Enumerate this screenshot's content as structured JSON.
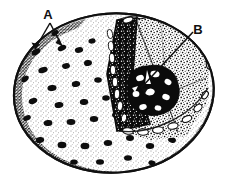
{
  "figure": {
    "medium": "black-and-white stipple line drawing",
    "background_color": "#ffffff",
    "ink_color": "#101010",
    "width_px": 225,
    "height_px": 182
  },
  "labels": [
    {
      "id": "label-a",
      "text": "A",
      "x": 48,
      "y": 19,
      "points_to": "dark oval surface pores on the outer body wall",
      "leader_count": 2
    },
    {
      "id": "label-b",
      "text": "B",
      "x": 198,
      "y": 34,
      "points_to": "irregular dark internal cluster inside the cutaway",
      "leader_count": 1
    }
  ],
  "leaders": [
    {
      "id": "leader-a-left",
      "x1": 50,
      "y1": 23,
      "x2": 35,
      "y2": 49
    },
    {
      "id": "leader-a-right",
      "x1": 50,
      "y1": 23,
      "x2": 62,
      "y2": 46
    },
    {
      "id": "leader-b",
      "x1": 193,
      "y1": 32,
      "x2": 141,
      "y2": 88
    }
  ],
  "regions": [
    {
      "id": "outer-body",
      "description": "ovoid stippled outer surface with scattered dark oval pores"
    },
    {
      "id": "cut-wedge-face",
      "description": "dark triangular sectioned wall face"
    },
    {
      "id": "interior-granular",
      "description": "finely stippled granular interior"
    },
    {
      "id": "internal-cluster",
      "description": "irregular dark blobby aggregate in the interior"
    },
    {
      "id": "cut-rim",
      "description": "rim of the cut edge drawn as white elongated blocks"
    },
    {
      "id": "lower-surface",
      "description": "darkly stippled lower surface with rows of pore openings"
    }
  ]
}
